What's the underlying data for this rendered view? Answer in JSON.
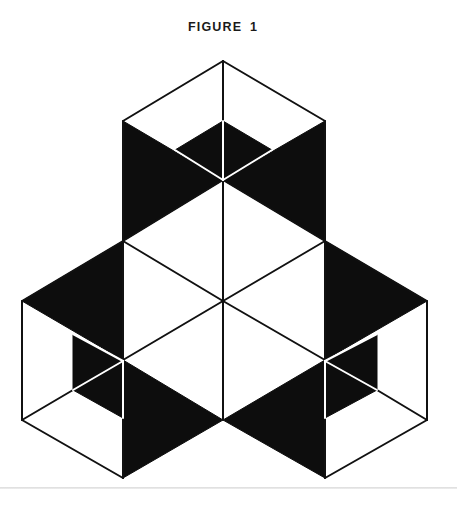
{
  "figure": {
    "title": "FIGURE 1",
    "stroke_color": "#111111",
    "fill_color": "#0d0d0d",
    "background": "#ffffff",
    "stroke_width": 2
  },
  "shapes": {
    "black_regions": [
      {
        "name": "top-cube-inner-diamond",
        "points": "175,150 223,121 272,150 223,180"
      },
      {
        "name": "top-cube-left-wedge",
        "points": "123,121 223,180 123,241"
      },
      {
        "name": "top-cube-right-wedge",
        "points": "325,121 223,180 325,241"
      },
      {
        "name": "left-cube-upper-wedge",
        "points": "22,301 123,241 123,360"
      },
      {
        "name": "left-cube-inner-panel",
        "points": "73,334 123,361 123,418 73,390"
      },
      {
        "name": "left-cube-lower-wedge",
        "points": "123,360 223,420 123,478"
      },
      {
        "name": "right-cube-upper-wedge",
        "points": "325,241 427,301 325,360"
      },
      {
        "name": "right-cube-inner-panel",
        "points": "377,334 325,361 325,418 377,390"
      },
      {
        "name": "right-cube-lower-wedge",
        "points": "325,360 223,420 325,478"
      }
    ],
    "black_lines": [
      {
        "name": "top-cube-upper-left-edge",
        "x1": 123,
        "y1": 121,
        "x2": 223,
        "y2": 61
      },
      {
        "name": "top-cube-upper-right-edge",
        "x1": 223,
        "y1": 61,
        "x2": 325,
        "y2": 121
      },
      {
        "name": "top-cube-left-side",
        "x1": 123,
        "y1": 121,
        "x2": 123,
        "y2": 241
      },
      {
        "name": "top-cube-right-side",
        "x1": 325,
        "y1": 121,
        "x2": 325,
        "y2": 241
      },
      {
        "name": "center-vertical-upper",
        "x1": 223,
        "y1": 61,
        "x2": 223,
        "y2": 121
      },
      {
        "name": "center-vertical-lower",
        "x1": 223,
        "y1": 180,
        "x2": 223,
        "y2": 420
      },
      {
        "name": "hex-upper-left-edge",
        "x1": 223,
        "y1": 180,
        "x2": 123,
        "y2": 241
      },
      {
        "name": "hex-upper-right-edge",
        "x1": 223,
        "y1": 180,
        "x2": 325,
        "y2": 241
      },
      {
        "name": "hex-diag-left-to-center",
        "x1": 123,
        "y1": 241,
        "x2": 223,
        "y2": 301
      },
      {
        "name": "hex-diag-right-to-center",
        "x1": 325,
        "y1": 241,
        "x2": 223,
        "y2": 301
      },
      {
        "name": "hex-center-to-lower-left",
        "x1": 223,
        "y1": 301,
        "x2": 123,
        "y2": 360
      },
      {
        "name": "hex-center-to-lower-right",
        "x1": 223,
        "y1": 301,
        "x2": 325,
        "y2": 360
      },
      {
        "name": "hex-left-side",
        "x1": 123,
        "y1": 241,
        "x2": 123,
        "y2": 478
      },
      {
        "name": "hex-right-side",
        "x1": 325,
        "y1": 241,
        "x2": 325,
        "y2": 478
      },
      {
        "name": "left-cube-top-edge",
        "x1": 22,
        "y1": 301,
        "x2": 123,
        "y2": 241
      },
      {
        "name": "left-cube-outer-side",
        "x1": 22,
        "y1": 301,
        "x2": 22,
        "y2": 420
      },
      {
        "name": "left-cube-bottom-edge",
        "x1": 22,
        "y1": 420,
        "x2": 123,
        "y2": 478
      },
      {
        "name": "left-cube-inner-floor-line",
        "x1": 22,
        "y1": 420,
        "x2": 73,
        "y2": 390
      },
      {
        "name": "right-cube-top-edge",
        "x1": 325,
        "y1": 241,
        "x2": 427,
        "y2": 301
      },
      {
        "name": "right-cube-outer-side",
        "x1": 427,
        "y1": 301,
        "x2": 427,
        "y2": 420
      },
      {
        "name": "right-cube-bottom-edge",
        "x1": 427,
        "y1": 420,
        "x2": 325,
        "y2": 478
      },
      {
        "name": "right-cube-inner-floor-line",
        "x1": 427,
        "y1": 420,
        "x2": 377,
        "y2": 390
      }
    ],
    "white_lines": [
      {
        "name": "top-inner-vertical",
        "x1": 223,
        "y1": 121,
        "x2": 223,
        "y2": 180
      },
      {
        "name": "top-inner-left-crease",
        "x1": 175,
        "y1": 150,
        "x2": 223,
        "y2": 180
      },
      {
        "name": "top-inner-right-crease",
        "x1": 272,
        "y1": 150,
        "x2": 223,
        "y2": 180
      },
      {
        "name": "left-inner-upper-crease",
        "x1": 73,
        "y1": 334,
        "x2": 123,
        "y2": 361
      },
      {
        "name": "left-inner-floor-crease",
        "x1": 73,
        "y1": 390,
        "x2": 123,
        "y2": 361
      },
      {
        "name": "left-inner-vertical",
        "x1": 123,
        "y1": 361,
        "x2": 123,
        "y2": 418
      },
      {
        "name": "right-inner-upper-crease",
        "x1": 377,
        "y1": 334,
        "x2": 325,
        "y2": 361
      },
      {
        "name": "right-inner-floor-crease",
        "x1": 377,
        "y1": 390,
        "x2": 325,
        "y2": 361
      },
      {
        "name": "right-inner-vertical",
        "x1": 325,
        "y1": 361,
        "x2": 325,
        "y2": 418
      }
    ]
  }
}
